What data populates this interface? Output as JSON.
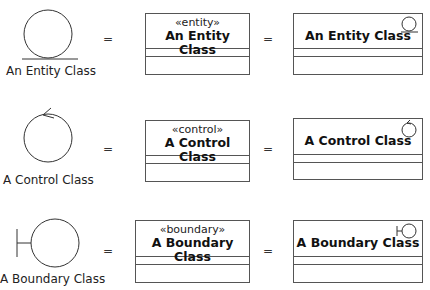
{
  "rows": [
    {
      "kind": "entity",
      "icon": "entity-icon",
      "icon_label": "An Entity Class",
      "equals_1": "=",
      "stereotype": "«entity»",
      "class_name": "An Entity Class",
      "equals_2": "=",
      "iconic_class_name": "An Entity Class"
    },
    {
      "kind": "control",
      "icon": "control-icon",
      "icon_label": "A Control Class",
      "equals_1": "=",
      "stereotype": "«control»",
      "class_name": "A Control Class",
      "equals_2": "=",
      "iconic_class_name": "A Control Class"
    },
    {
      "kind": "boundary",
      "icon": "boundary-icon",
      "icon_label": "A Boundary Class",
      "equals_1": "=",
      "stereotype": "«boundary»",
      "class_name": "A Boundary Class",
      "equals_2": "=",
      "iconic_class_name": "A Boundary Class"
    }
  ],
  "colors": {
    "line": "#555555",
    "text": "#111111",
    "background": "#ffffff"
  }
}
